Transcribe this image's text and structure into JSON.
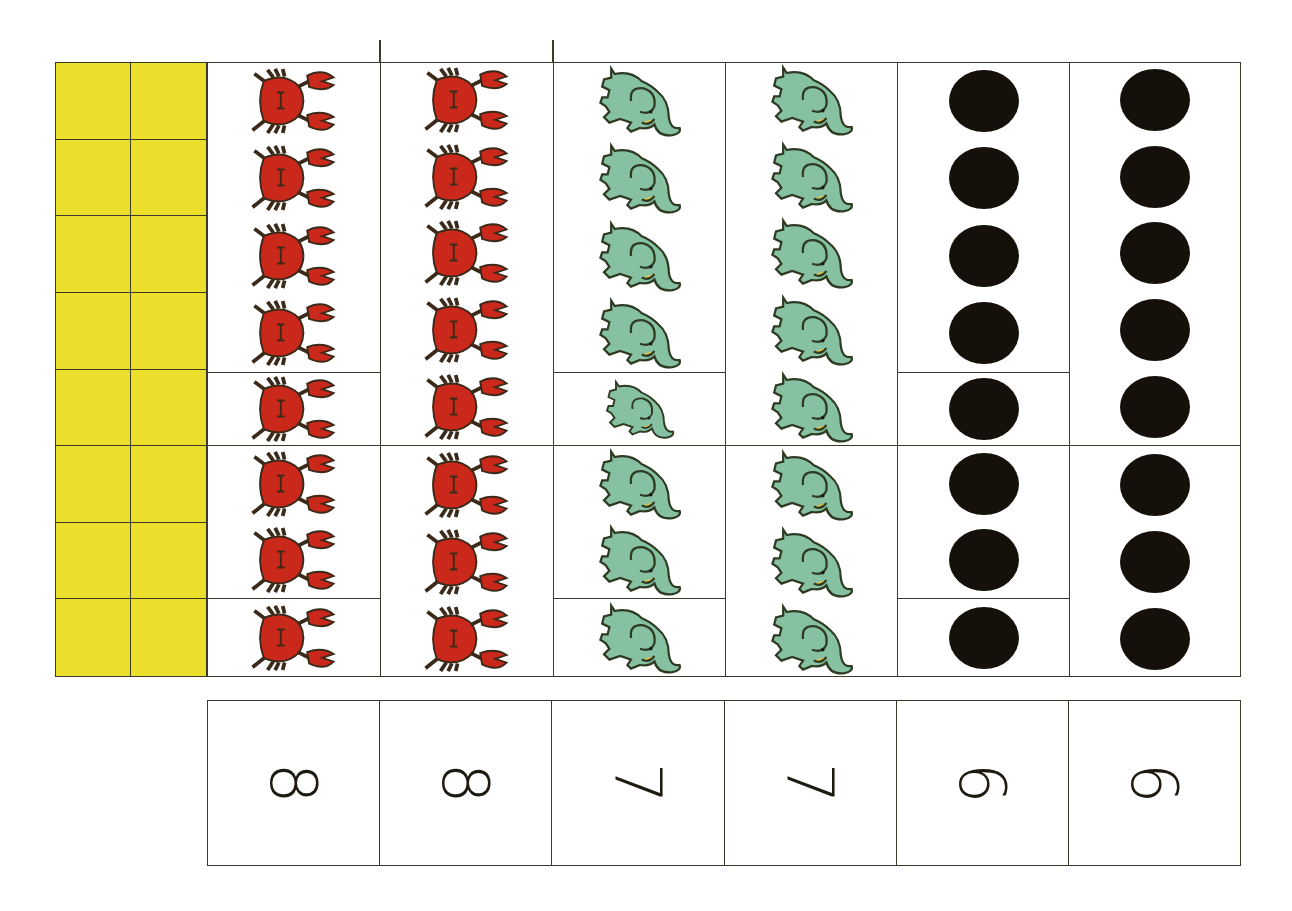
{
  "worksheet": {
    "orientation": "rotated-90-clockwise",
    "colors": {
      "ten_frame_fill": "#ECDF2C",
      "grid_line": "#3a3a2a",
      "crab": "#C9281B",
      "elephant": "#86C2A2",
      "dot": "#16100a",
      "background": "#ffffff"
    },
    "ten_frame": {
      "rows": 8,
      "cols": 2,
      "filled": 16
    },
    "columns": [
      {
        "id": "col-1",
        "icon": "crab-icon",
        "count": 8,
        "groups": [
          4,
          1,
          2,
          1
        ]
      },
      {
        "id": "col-2",
        "icon": "crab-icon",
        "count": 8,
        "groups": [
          5,
          3
        ]
      },
      {
        "id": "col-3",
        "icon": "elephant-icon",
        "count": 8,
        "groups": [
          4,
          1,
          2,
          1
        ]
      },
      {
        "id": "col-4",
        "icon": "elephant-icon",
        "count": 8,
        "groups": [
          5,
          3
        ]
      },
      {
        "id": "col-5",
        "icon": "dot-icon",
        "count": 8,
        "groups": [
          4,
          1,
          2,
          1
        ]
      },
      {
        "id": "col-6",
        "icon": "dot-icon",
        "count": 8,
        "groups": [
          5,
          3
        ]
      }
    ],
    "number_cards": [
      {
        "label": "8"
      },
      {
        "label": "8"
      },
      {
        "label": "7"
      },
      {
        "label": "7"
      },
      {
        "label": "6"
      },
      {
        "label": "6"
      }
    ]
  }
}
